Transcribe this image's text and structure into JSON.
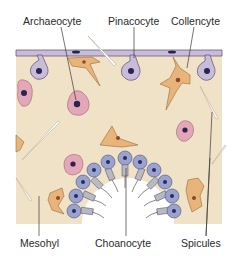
{
  "figure": {
    "colors": {
      "background": "#ffffff",
      "mesohyl": "#f0e2c6",
      "pinacocyte": "#c9bcd8",
      "pinacocyte_edge": "#6b5a80",
      "archaeocyte": "#e3a7b8",
      "collencyte": "#e8b47a",
      "choanocyte": "#9aa3cf",
      "collar": "#b9b9c4",
      "nucleus": "#2b2450",
      "leader_line": "#3a3a3a",
      "spicule": "#d8cfb8"
    }
  },
  "labels": {
    "top": [
      {
        "text": "Archaeocyte"
      },
      {
        "text": "Pinacocyte"
      },
      {
        "text": "Collencyte"
      }
    ],
    "bottom": [
      {
        "text": "Mesohyl"
      },
      {
        "text": "Choanocyte"
      },
      {
        "text": "Spicules"
      }
    ]
  }
}
